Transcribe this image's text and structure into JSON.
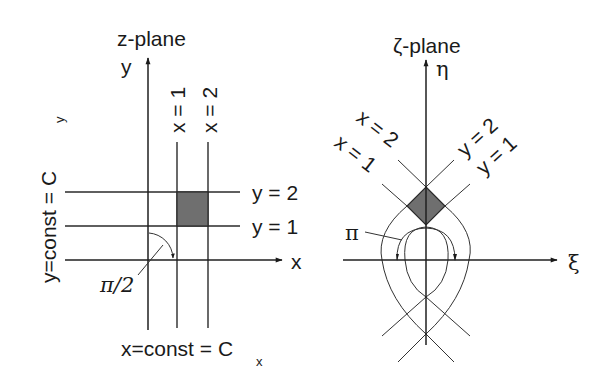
{
  "z_plane": {
    "title": "z-plane",
    "y_axis_label": "y",
    "x_axis_label": "x",
    "vertical_line_labels": [
      "x = 1",
      "x = 2"
    ],
    "horizontal_line_labels": [
      "y = 2",
      "y = 1"
    ],
    "angle_label": "π/2",
    "left_caption_main": "y=const = C",
    "left_caption_sub": "y",
    "bottom_caption_main": "x=const = C",
    "bottom_caption_sub": "x",
    "shaded_region": "square between x=1..2 and y=1..2",
    "shade_color": "#6f6f6f"
  },
  "zeta_plane": {
    "title": "ζ-plane",
    "eta_axis_label": "η",
    "xi_axis_label": "ξ",
    "x_curve_labels": [
      "x = 2",
      "x = 1"
    ],
    "y_curve_labels": [
      "y = 2",
      "y = 1"
    ],
    "angle_label": "π",
    "shaded_region": "curvilinear diamond (image of square)",
    "shade_color": "#6f6f6f"
  }
}
